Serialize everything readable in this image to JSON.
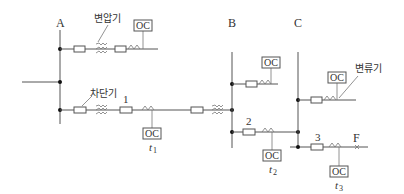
{
  "diagram": {
    "buses": [
      {
        "id": "A",
        "label": "A"
      },
      {
        "id": "B",
        "label": "B"
      },
      {
        "id": "C",
        "label": "C"
      }
    ],
    "annotations": {
      "transformer": "변압기",
      "breaker": "차단기",
      "current_transformer": "변류기"
    },
    "relays": [
      {
        "id": "top-A",
        "label": "OC"
      },
      {
        "id": "relay-1",
        "label": "OC",
        "time": "t",
        "time_sub": "1"
      },
      {
        "id": "top-B",
        "label": "OC"
      },
      {
        "id": "top-C",
        "label": "OC"
      },
      {
        "id": "relay-2",
        "label": "OC",
        "time": "t",
        "time_sub": "2"
      },
      {
        "id": "relay-3",
        "label": "OC",
        "time": "t",
        "time_sub": "3"
      }
    ],
    "breaker_numbers": [
      "1",
      "2",
      "3"
    ],
    "fault": {
      "label": "F"
    }
  }
}
